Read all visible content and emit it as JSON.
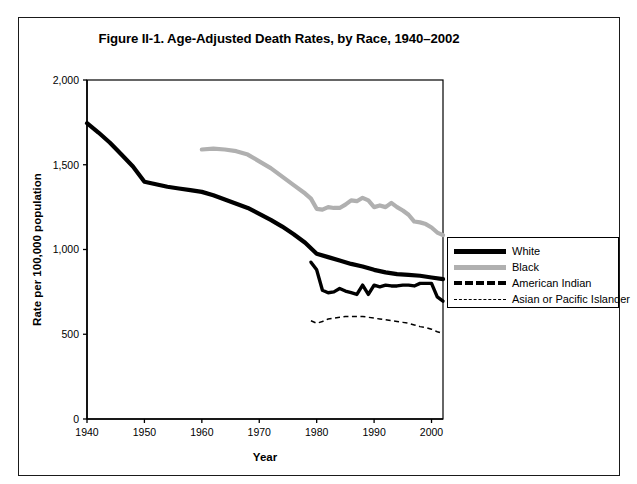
{
  "figure": {
    "title": "Figure II-1. Age-Adjusted Death Rates, by Race, 1940–2002"
  },
  "axes": {
    "y_title": "Rate per 100,000 population",
    "x_title": "Year",
    "y_ticks": [
      "0",
      "500",
      "1,000",
      "1,500",
      "2,000"
    ],
    "x_ticks": [
      "1940",
      "1950",
      "1960",
      "1970",
      "1980",
      "1990",
      "2000"
    ]
  },
  "legend": {
    "items": [
      {
        "label": "White",
        "style": "solid-thick-black",
        "color": "#000000"
      },
      {
        "label": "Black",
        "style": "solid-thick-gray",
        "color": "#b0b0b0"
      },
      {
        "label": "American Indian",
        "style": "dashed-thick-black",
        "color": "#000000"
      },
      {
        "label": "Asian or Pacific Islander",
        "style": "dashed-thin-black",
        "color": "#000000"
      }
    ]
  },
  "chart_data": {
    "type": "line",
    "title": "Figure II-1. Age-Adjusted Death Rates, by Race, 1940–2002",
    "xlabel": "Year",
    "ylabel": "Rate per 100,000 population",
    "xlim": [
      1940,
      2002
    ],
    "ylim": [
      0,
      2000
    ],
    "xticks": [
      1940,
      1950,
      1960,
      1970,
      1980,
      1990,
      2000
    ],
    "yticks": [
      0,
      500,
      1000,
      1500,
      2000
    ],
    "grid": false,
    "legend_position": "right",
    "series": [
      {
        "name": "White",
        "color": "#000000",
        "style": "solid-thick",
        "x": [
          1940,
          1942,
          1944,
          1946,
          1948,
          1950,
          1952,
          1954,
          1956,
          1958,
          1960,
          1962,
          1964,
          1966,
          1968,
          1970,
          1972,
          1974,
          1976,
          1978,
          1980,
          1982,
          1984,
          1986,
          1988,
          1990,
          1992,
          1994,
          1996,
          1998,
          2000,
          2002
        ],
        "values": [
          1745,
          1690,
          1630,
          1560,
          1490,
          1400,
          1385,
          1370,
          1360,
          1350,
          1340,
          1320,
          1295,
          1270,
          1245,
          1210,
          1175,
          1135,
          1090,
          1040,
          975,
          955,
          935,
          915,
          900,
          880,
          865,
          855,
          850,
          845,
          835,
          825
        ]
      },
      {
        "name": "Black",
        "color": "#b0b0b0",
        "style": "solid-thick",
        "x": [
          1960,
          1962,
          1964,
          1966,
          1968,
          1970,
          1972,
          1974,
          1976,
          1978,
          1979,
          1980,
          1981,
          1982,
          1983,
          1984,
          1985,
          1986,
          1987,
          1988,
          1989,
          1990,
          1991,
          1992,
          1993,
          1994,
          1995,
          1996,
          1997,
          1998,
          1999,
          2000,
          2001,
          2002
        ],
        "values": [
          1590,
          1595,
          1590,
          1580,
          1560,
          1520,
          1480,
          1430,
          1380,
          1330,
          1300,
          1240,
          1235,
          1250,
          1245,
          1245,
          1265,
          1290,
          1285,
          1305,
          1290,
          1250,
          1260,
          1250,
          1275,
          1250,
          1230,
          1205,
          1165,
          1160,
          1150,
          1130,
          1100,
          1085
        ]
      },
      {
        "name": "American Indian",
        "color": "#000000",
        "style": "dashed-thick",
        "x": [
          1979,
          1980,
          1981,
          1982,
          1983,
          1984,
          1985,
          1986,
          1987,
          1988,
          1989,
          1990,
          1991,
          1992,
          1993,
          1994,
          1995,
          1996,
          1997,
          1998,
          1999,
          2000,
          2001,
          2002
        ],
        "values": [
          925,
          880,
          760,
          745,
          750,
          770,
          755,
          745,
          735,
          790,
          735,
          790,
          780,
          790,
          785,
          785,
          790,
          790,
          785,
          800,
          800,
          800,
          720,
          695
        ]
      },
      {
        "name": "Asian or Pacific Islander",
        "color": "#000000",
        "style": "dashed-thin",
        "x": [
          1979,
          1980,
          1981,
          1982,
          1983,
          1984,
          1985,
          1986,
          1987,
          1988,
          1989,
          1990,
          1991,
          1992,
          1993,
          1994,
          1995,
          1996,
          1997,
          1998,
          1999,
          2000,
          2001,
          2002
        ],
        "values": [
          580,
          565,
          575,
          590,
          595,
          600,
          605,
          605,
          605,
          605,
          600,
          595,
          590,
          585,
          580,
          575,
          570,
          565,
          555,
          545,
          540,
          530,
          515,
          505
        ]
      }
    ]
  }
}
